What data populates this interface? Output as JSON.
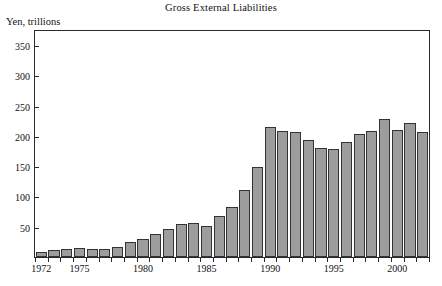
{
  "chart_data": {
    "type": "bar",
    "title": "Gross External Liabilities",
    "ylabel": "Yen, trillions",
    "xlabel": "",
    "ylim": [
      0,
      375
    ],
    "ytick_values": [
      50,
      100,
      150,
      200,
      250,
      300,
      350
    ],
    "ytick_labels": [
      "50",
      "100",
      "150",
      "200",
      "250",
      "300",
      "350"
    ],
    "xtick_labels": [
      "1972",
      "1975",
      "1980",
      "1985",
      "1990",
      "1995",
      "2000"
    ],
    "xtick_values": [
      1972,
      1975,
      1980,
      1985,
      1990,
      1995,
      2000
    ],
    "grid": false,
    "legend": false,
    "bar_color": "#9d9d9d",
    "bar_edge_color": "#333333",
    "categories": [
      1972,
      1973,
      1974,
      1975,
      1976,
      1977,
      1978,
      1979,
      1980,
      1981,
      1982,
      1983,
      1984,
      1985,
      1986,
      1987,
      1988,
      1989,
      1990,
      1991,
      1992,
      1993,
      1994,
      1995,
      1996,
      1997,
      1998,
      1999,
      2000,
      2001,
      2002
    ],
    "values": [
      9,
      11,
      14,
      15,
      14,
      14,
      16,
      24,
      30,
      38,
      46,
      55,
      57,
      52,
      68,
      82,
      110,
      148,
      215,
      209,
      207,
      193,
      180,
      178,
      190,
      203,
      209,
      228,
      210,
      222,
      207
    ],
    "units": "trillions of yen"
  }
}
